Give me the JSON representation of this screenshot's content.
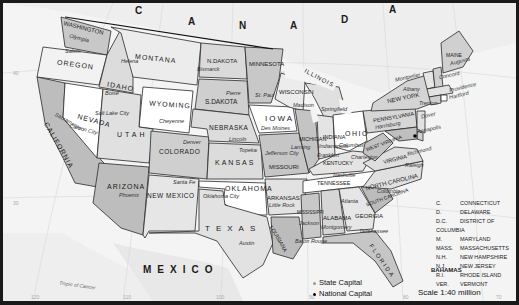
{
  "map": {
    "title": "United States",
    "countries": {
      "canada_letters": [
        "C",
        "A",
        "N",
        "A",
        "D",
        "A"
      ],
      "mexico": "MEXICO",
      "bahamas": "BAHAMAS"
    },
    "states": [
      {
        "id": "wa",
        "name": "WASHINGTON",
        "capital": "Olympia"
      },
      {
        "id": "or",
        "name": "OREGON",
        "capital": "Salem"
      },
      {
        "id": "ca",
        "name": "CALIFORNIA",
        "capital": "Sacramento"
      },
      {
        "id": "nv",
        "name": "NEVADA",
        "capital": "Carson City"
      },
      {
        "id": "id",
        "name": "IDAHO",
        "capital": "Boise"
      },
      {
        "id": "mt",
        "name": "MONTANA",
        "capital": "Helena"
      },
      {
        "id": "wy",
        "name": "WYOMING",
        "capital": "Cheyenne"
      },
      {
        "id": "ut",
        "name": "UTAH",
        "capital": "Salt Lake City"
      },
      {
        "id": "az",
        "name": "ARIZONA",
        "capital": "Phoenix"
      },
      {
        "id": "co",
        "name": "COLORADO",
        "capital": "Denver"
      },
      {
        "id": "nm",
        "name": "NEW MEXICO",
        "capital": "Santa Fe"
      },
      {
        "id": "nd",
        "name": "N.DAKOTA",
        "capital": "Bismarck"
      },
      {
        "id": "sd",
        "name": "S.DAKOTA",
        "capital": "Pierre"
      },
      {
        "id": "ne",
        "name": "NEBRASKA",
        "capital": "Lincoln"
      },
      {
        "id": "ks",
        "name": "KANSAS",
        "capital": "Topeka"
      },
      {
        "id": "ok",
        "name": "OKLAHOMA",
        "capital": "Oklahoma City"
      },
      {
        "id": "tx",
        "name": "TEXAS",
        "capital": "Austin"
      },
      {
        "id": "mn",
        "name": "MINNESOTA",
        "capital": "St. Paul"
      },
      {
        "id": "ia",
        "name": "IOWA",
        "capital": "Des Moines"
      },
      {
        "id": "mo",
        "name": "MISSOURI",
        "capital": "Jefferson City"
      },
      {
        "id": "ar",
        "name": "ARKANSAS",
        "capital": "Little Rock"
      },
      {
        "id": "la",
        "name": "LOUISIANA",
        "capital": "Baton Rouge"
      },
      {
        "id": "wi",
        "name": "WISCONSIN",
        "capital": "Madison"
      },
      {
        "id": "il",
        "name": "ILLINOIS",
        "capital": "Springfield"
      },
      {
        "id": "mi",
        "name": "MICHIGAN",
        "capital": "Lansing"
      },
      {
        "id": "in",
        "name": "INDIANA",
        "capital": "Indianapolis"
      },
      {
        "id": "oh",
        "name": "OHIO",
        "capital": "Columbus"
      },
      {
        "id": "ky",
        "name": "KENTUCKY",
        "capital": "Frankfort"
      },
      {
        "id": "tn",
        "name": "TENNESSEE",
        "capital": "Nashville"
      },
      {
        "id": "ms",
        "name": "MISSISSIPPI",
        "capital": "Jackson"
      },
      {
        "id": "al",
        "name": "ALABAMA",
        "capital": "Montgomery"
      },
      {
        "id": "ga",
        "name": "GEORGIA",
        "capital": "Atlanta"
      },
      {
        "id": "fl",
        "name": "FLORIDA",
        "capital": "Tallahassee"
      },
      {
        "id": "sc",
        "name": "SOUTH CAROLINA",
        "capital": "Columbia"
      },
      {
        "id": "nc",
        "name": "NORTH CAROLINA",
        "capital": "Raleigh"
      },
      {
        "id": "va",
        "name": "VIRGINIA",
        "capital": "Richmond"
      },
      {
        "id": "wv",
        "name": "WEST VIRGINIA",
        "capital": "Charleston"
      },
      {
        "id": "pa",
        "name": "PENNSYLVANIA",
        "capital": "Harrisburg"
      },
      {
        "id": "ny",
        "name": "NEW YORK",
        "capital": "Albany"
      },
      {
        "id": "vt",
        "name": "VER.",
        "capital": "Montpelier"
      },
      {
        "id": "nh",
        "name": "N.H.",
        "capital": "Concord"
      },
      {
        "id": "me",
        "name": "MAINE",
        "capital": "Augusta"
      },
      {
        "id": "ma",
        "name": "MASS.",
        "capital": "Boston"
      },
      {
        "id": "ri",
        "name": "R.I.",
        "capital": "Providence"
      },
      {
        "id": "ct",
        "name": "C.",
        "capital": "Hartford"
      },
      {
        "id": "nj",
        "name": "N.J.",
        "capital": "Trenton"
      },
      {
        "id": "de",
        "name": "D.",
        "capital": "Dover"
      },
      {
        "id": "md",
        "name": "M.",
        "capital": "Annapolis"
      },
      {
        "id": "dc",
        "name": "D.C.",
        "capital": "Washington"
      }
    ],
    "abbreviations": [
      {
        "abbr": "C.",
        "name": "CONNECTICUT"
      },
      {
        "abbr": "D.",
        "name": "DELAWARE"
      },
      {
        "abbr": "D.C.",
        "name": "DISTRICT OF COLUMBIA"
      },
      {
        "abbr": "M.",
        "name": "MARYLAND"
      },
      {
        "abbr": "MASS.",
        "name": "MASSACHUSETTS"
      },
      {
        "abbr": "N.H.",
        "name": "NEW HAMPSHIRE"
      },
      {
        "abbr": "N.J.",
        "name": "NEW JERSEY"
      },
      {
        "abbr": "R.I.",
        "name": "RHODE ISLAND"
      },
      {
        "abbr": "VER.",
        "name": "VERMONT"
      }
    ],
    "legend": {
      "state_capital": "State Capital",
      "national_capital": "National Capital"
    },
    "scale": "Scale  1:40 million",
    "tropic": "Tropic of Cancer",
    "graticule_labels": {
      "lat_40": "40",
      "lat_30": "30",
      "lon_120": "120",
      "lon_110": "110",
      "lon_100": "100",
      "lon_90": "90",
      "lon_80": "80",
      "lon_70": "70"
    },
    "colors": {
      "water": "#f4f4f4",
      "land_other": "#ececec",
      "state_white": "#ffffff",
      "state_light": "#dcdcdc",
      "state_mid": "#c8c8c8",
      "state_dark": "#b4b4b4",
      "border": "#222222"
    }
  }
}
